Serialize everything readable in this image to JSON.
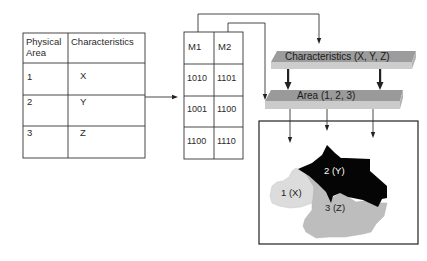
{
  "attribute_table": {
    "headers": [
      "Physical Area",
      "Characteristics"
    ],
    "header_line1": "Physical",
    "header_line2": "Area",
    "rows": [
      {
        "area": "1",
        "characteristic": "X"
      },
      {
        "area": "2",
        "characteristic": "Y"
      },
      {
        "area": "3",
        "characteristic": "Z"
      }
    ]
  },
  "code_table": {
    "headers": [
      "M1",
      "M2"
    ],
    "rows": [
      {
        "m1": "1010",
        "m2": "1101"
      },
      {
        "m1": "1001",
        "m2": "1100"
      },
      {
        "m1": "1100",
        "m2": "1110"
      }
    ]
  },
  "layers": {
    "top_label": "Characteristics (X, Y, Z)",
    "bottom_label": "Area (1, 2, 3)"
  },
  "map": {
    "regions": [
      {
        "label": "1 (X)",
        "color": "#dcdcdc"
      },
      {
        "label": "2 (Y)",
        "color": "#050505"
      },
      {
        "label": "3 (Z)",
        "color": "#bdbdbd"
      }
    ]
  },
  "colors": {
    "line": "#333333",
    "plate_top": "#9a9a9a",
    "plate_front": "#c8c8c8"
  }
}
